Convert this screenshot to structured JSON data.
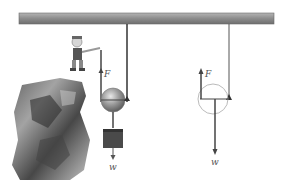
{
  "diagram": {
    "left_scene": {
      "force_label": "F",
      "weight_label": "w",
      "elements": [
        "ceiling-beam",
        "rope",
        "movable-pulley",
        "weight-block",
        "person",
        "cliff"
      ]
    },
    "right_scene": {
      "force_label": "F",
      "weight_label": "w",
      "elements": [
        "rope",
        "pulley-outline",
        "force-arrow-up",
        "weight-arrow-down"
      ]
    },
    "colors": {
      "beam": "#9a9a9a",
      "rope": "#333333",
      "pulley": "#8a8a8a",
      "block": "#4a4a4a",
      "arrow": "#444444",
      "outline": "#bbbbbb"
    }
  }
}
